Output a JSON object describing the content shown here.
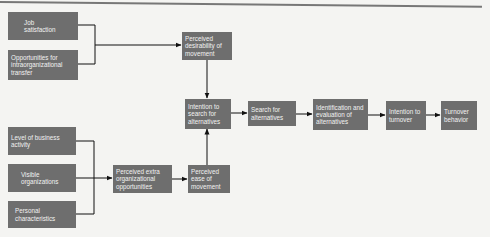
{
  "diagram": {
    "title": "",
    "nodes": [
      {
        "id": "job_satisfaction",
        "label": "Job satisfaction"
      },
      {
        "id": "opportunities_transfer",
        "label": "Opportunities for intraorganizational transfer"
      },
      {
        "id": "perceived_desirability",
        "label": "Perceived desirability of movement"
      },
      {
        "id": "intention_search",
        "label": "Intention to search for alternatives"
      },
      {
        "id": "search_alternatives",
        "label": "Search for alternatives"
      },
      {
        "id": "identification_evaluation",
        "label": "Identification and evaluation of alternatives"
      },
      {
        "id": "intention_turnover",
        "label": "Intention to turnover"
      },
      {
        "id": "turnover_behavior",
        "label": "Turnover behavior"
      },
      {
        "id": "level_business",
        "label": "Level of business activity"
      },
      {
        "id": "visible_orgs",
        "label": "Visible organizations"
      },
      {
        "id": "personal_characteristics",
        "label": "Personal characteristics"
      },
      {
        "id": "perceived_extra",
        "label": "Perceived extra organizational opportunities"
      },
      {
        "id": "perceived_ease",
        "label": "Perceived ease of movement"
      }
    ],
    "edges": [
      {
        "from": "job_satisfaction",
        "to": "perceived_desirability"
      },
      {
        "from": "opportunities_transfer",
        "to": "perceived_desirability"
      },
      {
        "from": "perceived_desirability",
        "to": "intention_search"
      },
      {
        "from": "intention_search",
        "to": "search_alternatives"
      },
      {
        "from": "search_alternatives",
        "to": "identification_evaluation"
      },
      {
        "from": "identification_evaluation",
        "to": "intention_turnover"
      },
      {
        "from": "intention_turnover",
        "to": "turnover_behavior"
      },
      {
        "from": "level_business",
        "to": "perceived_extra"
      },
      {
        "from": "visible_orgs",
        "to": "perceived_extra"
      },
      {
        "from": "personal_characteristics",
        "to": "perceived_extra"
      },
      {
        "from": "perceived_extra",
        "to": "perceived_ease"
      },
      {
        "from": "perceived_ease",
        "to": "intention_search"
      }
    ]
  },
  "labels": {
    "job_satisfaction": "Job satisfaction",
    "opportunities_transfer": "Opportunities for intraorganizational transfer",
    "perceived_desirability": "Perceived desirability of movement",
    "intention_search": "Intention to search for alternatives",
    "search_alternatives": "Search for alternatives",
    "identification_evaluation": "Identification and evaluation of alternatives",
    "intention_turnover": "Intention to turnover",
    "turnover_behavior": "Turnover behavior",
    "level_business": "Level of business activity",
    "visible_orgs": "Visible organizations",
    "personal_characteristics": "Personal characteristics",
    "perceived_extra": "Perceived extra organizational opportunities",
    "perceived_ease": "Perceived ease of movement"
  },
  "colors": {
    "box_fill": "#6e6e6e",
    "box_text": "#f2f2f2",
    "line": "#111111",
    "background": "#f4f4f2"
  }
}
